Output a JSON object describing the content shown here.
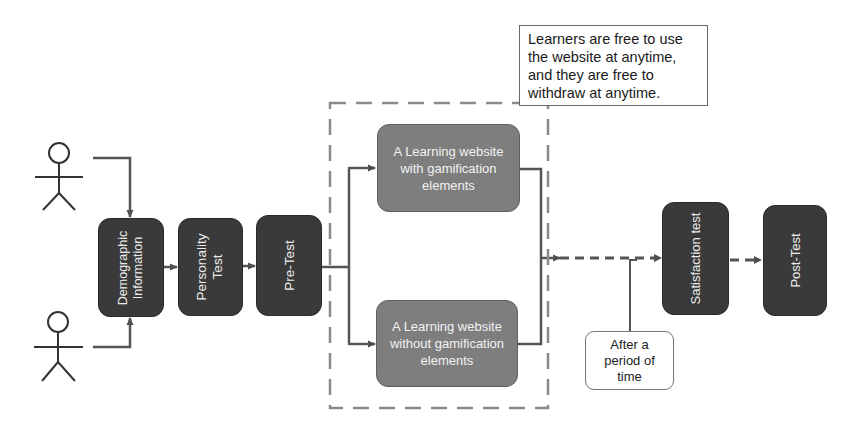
{
  "diagram": {
    "actors": [
      {
        "name": "learner-1",
        "head": [
          59,
          153
        ]
      },
      {
        "name": "learner-2",
        "head": [
          58,
          322
        ]
      }
    ],
    "steps": {
      "demographic": {
        "lines": [
          "Demographic",
          "Information"
        ]
      },
      "personality": {
        "lines": [
          "Personality",
          "Test"
        ]
      },
      "pretest": {
        "label": "Pre-Test"
      },
      "satisfaction": {
        "label": "Satisfaction test"
      },
      "posttest": {
        "label": "Post-Test"
      }
    },
    "groups": {
      "with_gamification": {
        "lines": [
          "A Learning website",
          "with gamification",
          "elements"
        ]
      },
      "without_gamification": {
        "lines": [
          "A Learning website",
          "without gamification",
          "elements"
        ]
      }
    },
    "note": {
      "lines": [
        "Learners are free to use",
        "the website at anytime,",
        "and they are free to",
        "withdraw at anytime."
      ]
    },
    "annotation": {
      "lines": [
        "After a",
        "period of",
        "time"
      ]
    },
    "colors": {
      "dark_box": "#3a3a3a",
      "gray_box": "#7e7e7e",
      "line": "#555555",
      "dashed_frame": "#8a8a8a"
    }
  }
}
